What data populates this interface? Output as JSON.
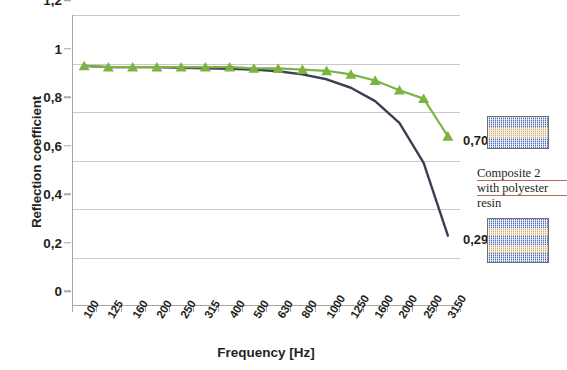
{
  "chart_data": {
    "type": "line",
    "title": "",
    "xlabel": "Frequency [Hz]",
    "ylabel": "Reflection coefficient",
    "categories": [
      "100",
      "125",
      "160",
      "200",
      "250",
      "315",
      "400",
      "500",
      "630",
      "800",
      "1000",
      "1250",
      "1600",
      "2000",
      "2500",
      "3150"
    ],
    "ylim": [
      0,
      1.2
    ],
    "yticks": [
      "0",
      "0,2",
      "0,4",
      "0,6",
      "0,8",
      "1",
      "1,2"
    ],
    "ytick_values": [
      0,
      0.2,
      0.4,
      0.6,
      0.8,
      1.0,
      1.2
    ],
    "grid": "horizontal",
    "legend": "none",
    "series": [
      {
        "name": "Composite 2 with polyester resin (3 layers)",
        "color": "#7cb342",
        "marker": "triangle",
        "values": [
          0.99,
          0.985,
          0.985,
          0.985,
          0.985,
          0.985,
          0.985,
          0.98,
          0.98,
          0.975,
          0.97,
          0.955,
          0.93,
          0.89,
          0.855,
          0.7
        ],
        "end_label": "0,70"
      },
      {
        "name": "Composite 2 with polyester resin (5 layers)",
        "color": "#3a3f52",
        "marker": "none",
        "values": [
          0.99,
          0.985,
          0.985,
          0.985,
          0.982,
          0.98,
          0.978,
          0.975,
          0.968,
          0.955,
          0.935,
          0.9,
          0.845,
          0.755,
          0.59,
          0.29
        ],
        "end_label": "0,29"
      }
    ],
    "annotations": [
      {
        "text": "0,70",
        "series": "green",
        "at_x": "3150",
        "at_y": 0.7
      },
      {
        "text": "0,29",
        "series": "dark",
        "at_x": "3150",
        "at_y": 0.29
      }
    ]
  },
  "samples": [
    {
      "name": "sample-3-layer",
      "layers": [
        "blue",
        "tan",
        "blue"
      ]
    },
    {
      "name": "sample-5-layer",
      "layers": [
        "blue",
        "tan",
        "blue",
        "tan",
        "blue"
      ]
    }
  ],
  "caption": {
    "line1": "Composite 2",
    "line2": "with polyester",
    "line3": "resin"
  }
}
